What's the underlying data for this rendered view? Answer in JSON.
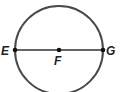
{
  "diagram": {
    "type": "circle-with-diameter",
    "stroke_color": "#4a4a4a",
    "point_color": "#111111",
    "circle": {
      "center": "F",
      "cx": 59,
      "cy": 50,
      "r": 44
    },
    "diameter": {
      "from": "E",
      "to": "G"
    },
    "points": [
      {
        "id": "E",
        "label": "E",
        "x": 15,
        "y": 50
      },
      {
        "id": "F",
        "label": "F",
        "x": 59,
        "y": 50
      },
      {
        "id": "G",
        "label": "G",
        "x": 103,
        "y": 50
      }
    ]
  }
}
